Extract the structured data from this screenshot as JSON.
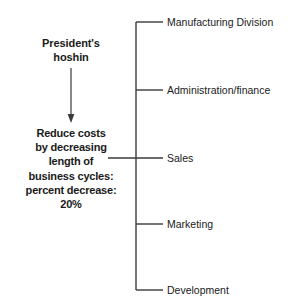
{
  "diagram": {
    "type": "hoshin-deployment-tree",
    "left": {
      "title_lines": [
        "President's",
        "hoshin"
      ],
      "objective_lines": [
        "Reduce costs",
        "by decreasing",
        "length of",
        "business cycles:",
        "percent decrease:",
        "20%"
      ]
    },
    "branches": [
      {
        "label": "Manufacturing Division",
        "y": 22
      },
      {
        "label": "Administration/finance",
        "y": 90
      },
      {
        "label": "Sales",
        "y": 158
      },
      {
        "label": "Marketing",
        "y": 224
      },
      {
        "label": "Development",
        "y": 290
      }
    ],
    "connector": {
      "arrow_from_y": 68,
      "arrow_to_y": 122,
      "arrow_x": 71,
      "spine_x": 136,
      "spine_top_y": 22,
      "spine_bottom_y": 290,
      "tick_end_x": 163,
      "cross_start_x": 108
    },
    "colors": {
      "background": "#ffffff",
      "line": "#3a3a3a",
      "text": "#1a1a1a",
      "label_text": "#202020"
    }
  }
}
